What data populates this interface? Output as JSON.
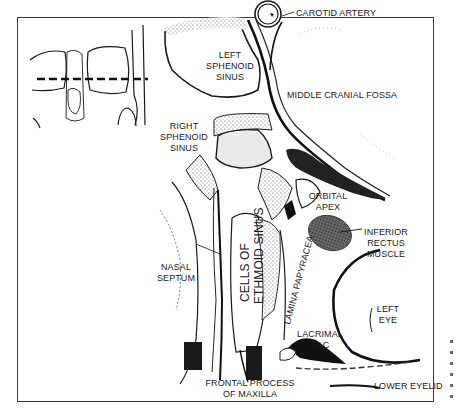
{
  "figure": {
    "type": "anatomical-cross-section",
    "view": "axial section through orbits and sphenoid sinuses",
    "inset": {
      "description": "frontal skull outline with dashed section line through orbits",
      "section_line": "dashed"
    },
    "labels": {
      "carotid_artery": "CAROTID ARTERY",
      "left_sphenoid_sinus": [
        "LEFT",
        "SPHENOID",
        "SINUS"
      ],
      "middle_cranial_fossa": "MIDDLE CRANIAL FOSSA",
      "right_sphenoid_sinus": [
        "RIGHT",
        "SPHENOID",
        "SINUS"
      ],
      "orbital_apex": [
        "ORBITAL",
        "APEX"
      ],
      "inferior_rectus_muscle": [
        "INFERIOR",
        "RECTUS",
        "MUSCLE"
      ],
      "nasal_septum": [
        "NASAL",
        "SEPTUM"
      ],
      "cells_of_ethmoid_sinus": [
        "CELLS OF",
        "ETHMOID SINUS"
      ],
      "lamina_papyracea": "LAMINA PAPYRACEA",
      "left_eye": [
        "LEFT",
        "EYE"
      ],
      "lacrimal_sac": [
        "LACRIMAL",
        "SAC"
      ],
      "frontal_process_of_maxilla": [
        "FRONTAL PROCESS",
        "OF MAXILLA"
      ],
      "lower_eyelid": "LOWER EYELID"
    },
    "colors": {
      "ink": "#1a1a1a",
      "frame": "#3a3a3a",
      "stipple": "#555555",
      "muscle": "#4a4a4a",
      "background": "#ffffff"
    }
  }
}
